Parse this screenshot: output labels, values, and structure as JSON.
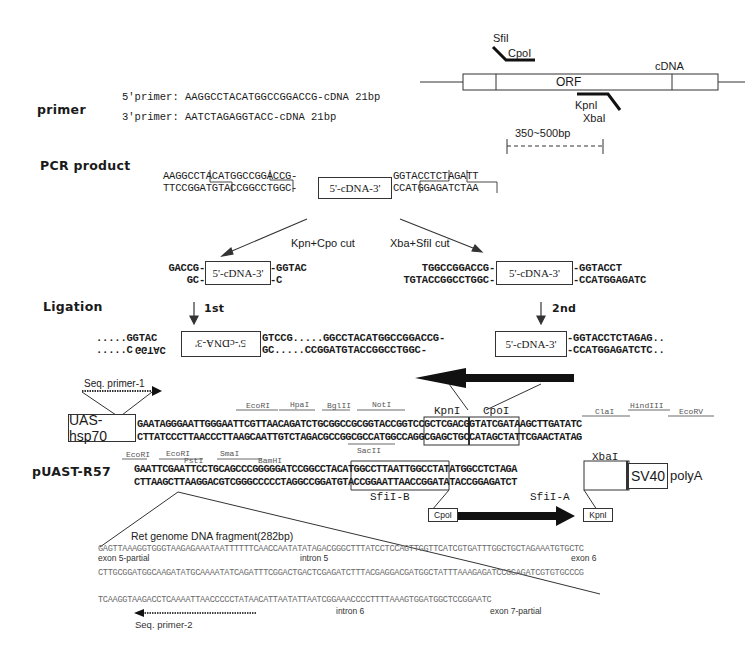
{
  "sections": {
    "primer": "primer",
    "pcr_product": "PCR product",
    "ligation": "Ligation",
    "vector": "pUAST-R57"
  },
  "cdna_map": {
    "orf_label": "ORF",
    "cdna_label": "cDNA",
    "top_sites": [
      "SfiI",
      "CpoI"
    ],
    "bottom_sites": [
      "KpnI",
      "XbaI"
    ],
    "size_label": "350~500bp"
  },
  "primers": {
    "forward": "5'primer: AAGGCCTACATGGCCGGACCG-cDNA 21bp",
    "reverse": "3'primer: AATCTAGAGGTACC-cDNA 21bp"
  },
  "pcr": {
    "left_top": "AAGGCCTACATGGCCGGACCG-",
    "left_bottom": "TTCCGGATGTACCGGCCTGGC-",
    "insert": "5'-cDNA-3'",
    "right_top": "GGTACCTCTAGATT",
    "right_bottom": "CCATGGAGATCTAA"
  },
  "cuts": {
    "left_label": "Kpn+Cpo cut",
    "right_label": "Xba+SfiI cut",
    "left_frag": {
      "lt": "GACCG-",
      "lb": "GC-",
      "insert": "5'-cDNA-3'",
      "rt": "-GGTAC",
      "rb": "-C"
    },
    "right_frag": {
      "lt": "TGGCCGGACCG-",
      "lb": "TGTACCGGCCTGGC-",
      "insert": "5'-cDNA-3'",
      "rt": "-GGTACCT",
      "rb": "-CCATGGAGATC"
    }
  },
  "ligation": {
    "step1": "1st",
    "step2": "2nd",
    "row_top_left": ".....GGTAC",
    "row_bottom_left": ".....C",
    "row_bottom_left_rev": "GGTAC",
    "insert1_rev": "5'-cDNA-3'",
    "mid_top": "GTCCG.....GGCCTACATGGCCGGACCG-",
    "mid_bottom": "GC.....CCGGATGTACCGGCCTGGC-",
    "insert2": "5'-cDNA-3'",
    "right_top": "-GGTACCTCTAGAG..",
    "right_bottom": "-CCATGGAGATCTC.."
  },
  "vector": {
    "seq_primer_1": "Seq. primer-1",
    "promoter": "UAS-hsp70",
    "row1_top": "GAATAGGGAATTGGGAATTCGTTAACAGATCTGCGGCCGCGGTACCGGTCCGCTCGACGGTATCGATAAGCTTGATATC",
    "row1_bottom": "CTTATCCCTTAACCCTTAAGCAATTGTCTAGACGCCGGCGCCATGGCCAGGCGAGCTGCCATAGCTATTCGAACTATAG",
    "row1_sites": [
      "EcoRI",
      "HpaI",
      "BglII",
      "NotI",
      "KpnI",
      "CpoI",
      "ClaI",
      "HindIII",
      "EcoRV"
    ],
    "row2_sites": [
      "EcoRI",
      "EcoRI",
      "PstI",
      "SmaI",
      "BamHI",
      "SacII",
      "XbaI"
    ],
    "row2_top": "GAATTCGAATTCCTGCAGCCCGGGGGATCCGGCCTACATGGCCTTAATTGGCCTATATGGCCTCTAGA",
    "row2_bottom": "CTTAAGCTTAAGGACGTCGGGCCCCCTAGGCCGGATGTACCGGAATTAACCGGATATACCGGAGATCT",
    "sfi_b": "SfiI-B",
    "sfi_a": "SfiI-A",
    "sv40": "SV40",
    "polya": "polyA",
    "arrow_left": "CpoI",
    "arrow_right": "KpnI"
  },
  "genome": {
    "title": "Ret genome DNA fragment(282bp)",
    "line1": "GAGTTAAAGGTGGGTAAGAGAAATAATTTTTTCAACCAATATATAGACGGGCTTTATCCTCCAGTTGGTTCATCGTGATTTGGCTGCTAGAAATGTGCTC",
    "line2": "CTTGCGGATGGCAAGATATGCAAAATATCAGATTTCGGACTGACTCGAGATCTTTACGAGGACGATGGCTATTTAAAGAGATCCGGAGATCGTGTGCCCG",
    "line3": "TCAAGGTAAGACCTCAAAATTAACCCCCTATAACATTAATATTAATCGGAAACCCCTTTTAAAGTGGATGGCTCCGGAATC",
    "exon5": "exon 5-partial",
    "intron5": "intron 5",
    "exon6": "exon 6",
    "intron6": "intron 6",
    "exon7": "exon 7-partial",
    "seq_primer_2": "Seq. primer-2"
  }
}
